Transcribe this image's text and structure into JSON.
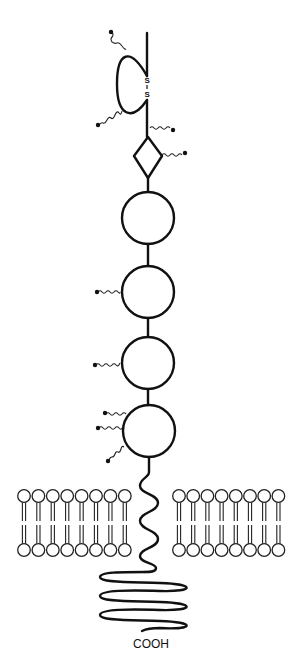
{
  "diagram": {
    "type": "transmembrane-glycoprotein-schematic",
    "colors": {
      "line": "#111111",
      "background": "#ffffff"
    },
    "n_terminal_loop": {
      "disulfide_label_top": "S",
      "disulfide_bond": "|",
      "disulfide_label_bottom": "S",
      "glycan_chains": 2
    },
    "diamond_domain": {
      "glycan_chains": 2
    },
    "globular_domains": [
      {
        "index": 1,
        "glycan_chains": 0
      },
      {
        "index": 2,
        "glycan_chains": 1
      },
      {
        "index": 3,
        "glycan_chains": 1
      },
      {
        "index": 4,
        "glycan_chains": 3
      }
    ],
    "membrane": {
      "left_bilayer_lipids": 8,
      "right_bilayer_lipids": 8
    },
    "c_terminus_label": "COOH"
  }
}
